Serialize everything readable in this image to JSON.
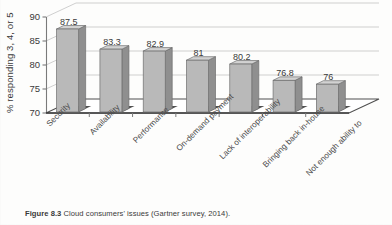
{
  "chart_data": {
    "type": "bar",
    "title": "",
    "subtitle": "",
    "xlabel": "",
    "ylabel": "% responding 3, 4, or 5",
    "ylim": [
      70,
      90
    ],
    "yticks": [
      70,
      75,
      80,
      85,
      90
    ],
    "ytick_labels": [
      "70",
      "75",
      "80",
      "85",
      "90"
    ],
    "grid": true,
    "legend": false,
    "legend_position": "none",
    "style": "3d-column",
    "categories": [
      "Security",
      "Availability",
      "Performance",
      "On-demand payment",
      "Lack of interoperability",
      "Bringing back in-house",
      "Not enough ability to"
    ],
    "values": [
      87.5,
      83.3,
      82.9,
      81,
      80.2,
      76.8,
      76
    ],
    "data_labels": [
      "87.5",
      "83.3",
      "82.9",
      "81",
      "80.2",
      "76.8",
      "76"
    ],
    "series": [
      {
        "name": "% responding 3, 4, or 5",
        "values": [
          87.5,
          83.3,
          82.9,
          81,
          80.2,
          76.8,
          76
        ]
      }
    ]
  },
  "colors": {
    "bar_front": "#b9b9b9",
    "bar_side": "#8f8f8f",
    "bar_top": "#d2d2d2",
    "bar_outline": "#6e6e6e",
    "grid": "#c9c9c9",
    "axis": "#7a7a7a",
    "floor": "#ffffff",
    "floor_edge": "#555555",
    "shadow": "#3d3d3d",
    "text": "#3a3a3a",
    "page": "#fdfdfc"
  },
  "caption": {
    "figure_number": "Figure 8.3",
    "text": "Cloud consumers' issues (Gartner survey, 2014)."
  }
}
